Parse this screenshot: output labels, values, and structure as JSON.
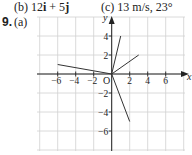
{
  "answers": {
    "part_b": {
      "label": "(b)",
      "pre": " 12",
      "i": "i",
      "mid": " + 5",
      "j": "j"
    },
    "part_c": {
      "label": "(c)",
      "text": " 13 m/s, 23°"
    },
    "question_number": "9.",
    "part_a_label": "(a)"
  },
  "colors": {
    "grid": "#d0d0d0",
    "axis": "#222222",
    "vector": "#333333"
  },
  "chart_data": {
    "type": "line",
    "subtype": "vector-diagram",
    "title": "",
    "xlabel": "x",
    "ylabel": "y",
    "origin_label": "O",
    "xlim": [
      -8,
      8
    ],
    "ylim": [
      -8,
      6
    ],
    "grid": true,
    "grid_step": 2,
    "x_ticks": [
      -6,
      -4,
      -2,
      2,
      4,
      6
    ],
    "x_tick_labels": [
      "−6",
      "−4",
      "−2",
      "2",
      "4",
      "6"
    ],
    "y_ticks": [
      4,
      2,
      -2,
      -4,
      -6
    ],
    "y_tick_labels": [
      "4",
      "2",
      "−2",
      "−4",
      "−6"
    ],
    "vectors": [
      {
        "from": [
          0,
          0
        ],
        "to": [
          -6,
          1
        ]
      },
      {
        "from": [
          0,
          0
        ],
        "to": [
          1,
          4
        ]
      },
      {
        "from": [
          0,
          0
        ],
        "to": [
          3,
          2
        ]
      },
      {
        "from": [
          0,
          0
        ],
        "to": [
          2,
          -5
        ]
      }
    ]
  }
}
